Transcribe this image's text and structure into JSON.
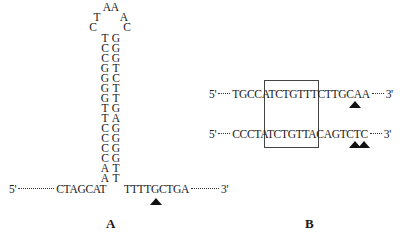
{
  "panel_a": {
    "label": "A",
    "loop": {
      "top": [
        "A",
        "A"
      ],
      "left": [
        "T",
        "C"
      ],
      "right": [
        "A",
        "C"
      ]
    },
    "stem": [
      {
        "left": "T",
        "right": "G"
      },
      {
        "left": "C",
        "right": "G"
      },
      {
        "left": "C",
        "right": "G"
      },
      {
        "left": "G",
        "right": "T"
      },
      {
        "left": "G",
        "right": "C"
      },
      {
        "left": "G",
        "right": "T"
      },
      {
        "left": "G",
        "right": "T"
      },
      {
        "left": "T",
        "right": "G"
      },
      {
        "left": "T",
        "right": "A"
      },
      {
        "left": "C",
        "right": "G"
      },
      {
        "left": "C",
        "right": "G"
      },
      {
        "left": "C",
        "right": "G"
      },
      {
        "left": "C",
        "right": "G"
      },
      {
        "left": "A",
        "right": "T"
      },
      {
        "left": "A",
        "right": "T"
      }
    ],
    "five_prime": "5'",
    "left_sequence": "CTAGCAT",
    "right_sequence": "TTTTGCTGA",
    "three_prime": "3'",
    "cleavage_marker": "triangle below G of TTTTGCTGA"
  },
  "panel_b": {
    "label": "B",
    "sequences": [
      {
        "five_prime": "5'",
        "prefix": "TGCC",
        "boxed": "ATCTGTT",
        "suffix": "TCTTGCAA",
        "three_prime": "3'",
        "markers": 1
      },
      {
        "five_prime": "5'",
        "prefix": "CCCT",
        "boxed": "ATCTGTT",
        "suffix": "ACAGTCTC",
        "three_prime": "3'",
        "markers": 2
      }
    ]
  }
}
